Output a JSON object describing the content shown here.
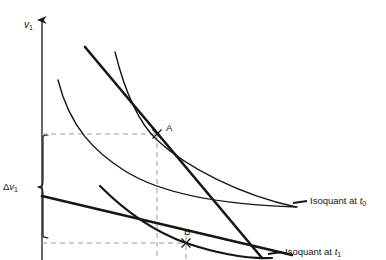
{
  "figure": {
    "type": "economics-isoquant-diagram",
    "background_color": "#ffffff",
    "ink_color": "#161616",
    "dash_color": "#9a9a9a",
    "width": 386,
    "height": 260
  },
  "axes": {
    "y_axis": {
      "label_main": "v",
      "label_sub": "1",
      "name": "v1",
      "has_arrow": true,
      "x_px": 42,
      "top_px": 18,
      "bottom_px": 260
    },
    "x_axis_visible": false
  },
  "annotations": {
    "delta": {
      "symbol": "Δ",
      "var": "v",
      "sub": "1",
      "brace": "left-curly",
      "span_top_px": 135,
      "span_bottom_px": 238
    }
  },
  "points": [
    {
      "name": "A",
      "label": "A",
      "marker": "x-cross",
      "x_px": 157,
      "y_px": 134,
      "label_dx": 9,
      "label_dy": -11
    },
    {
      "name": "B",
      "label": "B",
      "marker": "x-cross",
      "x_px": 186,
      "y_px": 243,
      "label_dx": -2,
      "label_dy": -16
    }
  ],
  "legend": [
    {
      "id": "isoquant-t0",
      "text_main": "Isoquant at ",
      "text_var": "t",
      "text_sub": "0",
      "full": "Isoquant at t0",
      "x_px": 308,
      "y_px": 197,
      "leader_from_x": 293,
      "leader_from_y": 203
    },
    {
      "id": "isoquant-t1",
      "text_main": "Isoquant at ",
      "text_var": "t",
      "text_sub": "1",
      "full": "Isoquant at t1",
      "x_px": 283,
      "y_px": 247,
      "leader_from_x": 268,
      "leader_from_y": 253
    }
  ],
  "curves": {
    "isoquant_t0": {
      "style": "thin",
      "stroke_width": 1.4,
      "path": "M 58,80 C 70,128 95,152 125,171 C 165,196 230,205 297,207"
    },
    "isoquant_t1": {
      "style": "thin",
      "stroke_width": 1.4,
      "path": "M 115,52 C 124,110 140,160 165,197 C 190,232 230,250 272,257"
    },
    "isocost_t0": {
      "style": "thick",
      "stroke_width": 2.6,
      "path": "M 85,47 L 260,258"
    },
    "isocost_t1": {
      "style": "thick",
      "stroke_width": 2.6,
      "path": "M 42,196 L 290,254"
    },
    "isoquant_t0_thick_overlay": {
      "style": "thick",
      "stroke_width": 2.6,
      "path": "M 115,52 C 124,110 140,160 165,197"
    },
    "isoquant_t1_thick_overlay": {
      "style": "thick",
      "stroke_width": 2.6,
      "path": "M 165,197 C 190,232 230,250 272,257"
    }
  },
  "guide_lines": [
    {
      "id": "hline-A",
      "orientation": "horizontal",
      "x1": 42,
      "y1": 134,
      "x2": 160,
      "y2": 134
    },
    {
      "id": "hline-B",
      "orientation": "horizontal",
      "x1": 42,
      "y1": 243,
      "x2": 190,
      "y2": 243
    },
    {
      "id": "vline-A",
      "orientation": "vertical",
      "x1": 157,
      "y1": 134,
      "x2": 157,
      "y2": 260
    },
    {
      "id": "vline-B",
      "orientation": "vertical",
      "x1": 186,
      "y1": 237,
      "x2": 186,
      "y2": 260
    }
  ],
  "top_clipped_text": ""
}
